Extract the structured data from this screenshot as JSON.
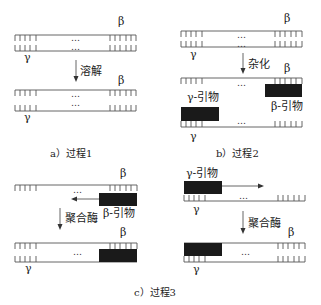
{
  "greek": {
    "beta": "β",
    "gamma": "γ"
  },
  "ellipsis": "…",
  "panels": {
    "a": {
      "caption": "a）过程1",
      "step_label": "溶解"
    },
    "b": {
      "caption": "b）过程2",
      "step_label": "杂化",
      "gamma_primer": "γ-引物",
      "beta_primer": "β-引物"
    },
    "c": {
      "caption": "c）过程3",
      "left": {
        "step_label": "聚合酶",
        "beta_primer": "β-引物"
      },
      "right": {
        "step_label": "聚合酶",
        "gamma_primer": "γ-引物"
      }
    }
  },
  "colors": {
    "line": "#555555",
    "primer": "#1a1a1a"
  }
}
